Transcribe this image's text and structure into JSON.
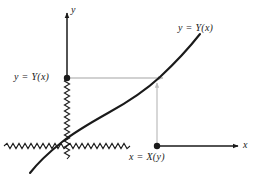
{
  "figure": {
    "kind": "math-diagram",
    "background_color": "#ffffff",
    "axes": {
      "x_axis_label": "x",
      "y_axis_label": "y",
      "axis_color": "#1a1a1a",
      "origin": {
        "x": 67,
        "y": 146
      }
    },
    "curve": {
      "label": "y = Y(x)",
      "color": "#1a1a1a",
      "stroke_width": 2.1,
      "path": "M 30,173 C 40,160 52,150 62,142 C 76,131 92,122 108,113 C 128,102 146,90 160,77 C 175,63 189,48 200,34"
    },
    "points": [
      {
        "name": "y-axis-point",
        "label": "y = Y(x)",
        "x": 67,
        "y": 78,
        "radius": 3.2,
        "color": "#1a1a1a"
      },
      {
        "name": "x-axis-point",
        "label": "x = X(y)",
        "x": 157,
        "y": 146,
        "radius": 3.2,
        "color": "#1a1a1a"
      }
    ],
    "guides": {
      "color": "#c2c2c2",
      "stroke_width": 1.3,
      "horizontal": {
        "name": "horizontal-guide-arrow",
        "from_x": 67,
        "to_x": 163,
        "y": 78,
        "direction": "right"
      },
      "vertical": {
        "name": "vertical-guide-arrow",
        "x": 157,
        "from_y": 146,
        "to_y": 83,
        "direction": "up"
      }
    },
    "labels": {
      "curve": "y = Y(x)",
      "y_value": "y = Y(x)",
      "x_value": "x = X(y)",
      "axis_x": "x",
      "axis_y": "y"
    }
  }
}
